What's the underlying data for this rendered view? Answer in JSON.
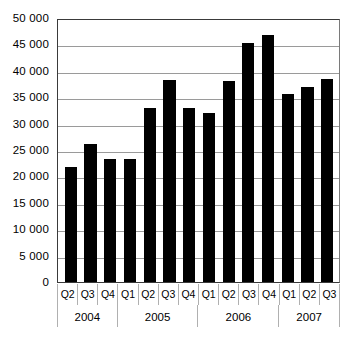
{
  "chart_data": {
    "type": "bar",
    "title": "",
    "subtitle": "",
    "xlabel": "",
    "ylabel": "",
    "categories": [
      "Q2",
      "Q3",
      "Q4",
      "Q1",
      "Q2",
      "Q3",
      "Q4",
      "Q1",
      "Q2",
      "Q3",
      "Q4",
      "Q1",
      "Q2",
      "Q3"
    ],
    "group_labels": [
      "2004",
      "2005",
      "2006",
      "2007"
    ],
    "group_spans": [
      3,
      4,
      4,
      3
    ],
    "x": [
      "2004 Q2",
      "2004 Q3",
      "2004 Q4",
      "2005 Q1",
      "2005 Q2",
      "2005 Q3",
      "2005 Q4",
      "2006 Q1",
      "2006 Q2",
      "2006 Q3",
      "2006 Q4",
      "2007 Q1",
      "2007 Q2",
      "2007 Q3"
    ],
    "values": [
      21700,
      26200,
      23300,
      23300,
      33000,
      38200,
      33000,
      32000,
      38000,
      45300,
      46800,
      35600,
      37000,
      38500
    ],
    "ylim": [
      0,
      50000
    ],
    "ytick_values": [
      50000,
      45000,
      40000,
      35000,
      30000,
      25000,
      20000,
      15000,
      10000,
      5000,
      0
    ],
    "ytick_labels": [
      "50 000",
      "45 000",
      "40 000",
      "35 000",
      "30 000",
      "25 000",
      "20 000",
      "15 000",
      "10 000",
      "5 000",
      "0"
    ],
    "grid": true,
    "legend": null,
    "bar_color": "#000000",
    "grid_color": "#9a9a9a",
    "axis_color": "#3a3a3a",
    "background_color": "#ffffff"
  }
}
